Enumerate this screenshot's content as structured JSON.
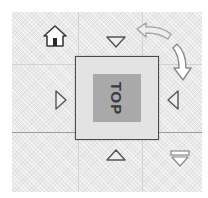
{
  "viewcube": {
    "face_label": "TOP",
    "icons": {
      "home": "home-icon",
      "rotate_left": "rotate-counterclockwise-arrow-icon",
      "rotate_right": "rotate-clockwise-arrow-icon",
      "arrow_up": "triangle-down-icon",
      "arrow_down": "triangle-up-icon",
      "arrow_left": "triangle-right-icon",
      "arrow_right": "triangle-left-icon",
      "menu": "dropdown-menu-icon"
    },
    "colors": {
      "background": "#e9e9e9",
      "face": "#a9a9a9",
      "border": "#4a4a4a",
      "text": "#3a3a3a"
    }
  }
}
